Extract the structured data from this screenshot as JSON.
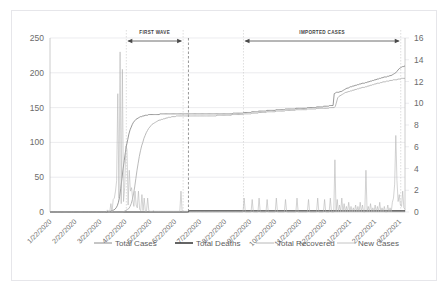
{
  "chart_data": {
    "type": "line",
    "title": "",
    "xlabel": "",
    "ylabel": "",
    "grid": true,
    "legend_position": "bottom",
    "y_left": {
      "label": "",
      "ticks": [
        0,
        50,
        100,
        150,
        200,
        250
      ],
      "ylim": [
        0,
        250
      ]
    },
    "y_right": {
      "label": "",
      "ticks": [
        0,
        2,
        4,
        6,
        8,
        10,
        12,
        14,
        16
      ],
      "ylim": [
        0,
        16
      ]
    },
    "x_tick_labels": [
      "1/22/2020",
      "2/22/2020",
      "3/22/2020",
      "4/22/2020",
      "5/22/2020",
      "6/22/2020",
      "7/22/2020",
      "8/22/2020",
      "9/22/2020",
      "10/22/2020",
      "11/22/2020",
      "12/22/2020",
      "1/22/2021",
      "2/22/2021",
      "3/22/2021"
    ],
    "annotations": [
      {
        "name": "first-wave",
        "label": "FIRST WAVE",
        "x_start": 0.215,
        "x_end": 0.375
      },
      {
        "name": "imported-cases",
        "label": "IMPORTED CASES",
        "x_start": 0.545,
        "x_end": 0.988
      }
    ],
    "vertical_markers": [
      {
        "name": "phase-divider",
        "x": 0.39
      }
    ],
    "series": [
      {
        "name": "Total Cases",
        "axis": "left",
        "color": "#7f7f7f",
        "width": 0.8,
        "values": [
          0,
          0,
          0,
          0,
          0,
          0,
          0,
          0,
          0,
          0,
          0,
          0,
          0,
          0,
          0,
          0,
          0,
          0,
          0,
          0,
          0,
          0,
          0,
          0,
          0,
          0,
          0,
          0,
          0,
          0,
          0,
          0,
          0,
          0,
          0,
          0,
          0,
          0,
          0,
          0,
          0,
          0,
          0,
          0,
          0,
          0,
          0,
          0,
          0,
          0,
          1,
          1,
          1,
          2,
          2,
          3,
          4,
          6,
          9,
          14,
          22,
          34,
          48,
          62,
          74,
          86,
          96,
          104,
          112,
          118,
          122,
          126,
          129,
          131,
          133,
          134,
          135,
          136,
          137,
          137,
          138,
          138,
          139,
          139,
          139,
          140,
          140,
          140,
          140,
          140,
          140,
          140,
          140,
          140,
          140,
          141,
          141,
          141,
          141,
          141,
          141,
          141,
          141,
          141,
          141,
          141,
          141,
          141,
          141,
          141,
          141,
          141,
          141,
          141,
          141,
          141,
          141,
          141,
          141,
          141,
          141,
          141,
          141,
          141,
          141,
          141,
          141,
          141,
          141,
          141,
          141,
          141,
          141,
          141,
          141,
          141,
          141,
          141,
          141,
          141,
          141,
          141,
          141,
          141,
          141,
          141,
          141,
          141,
          141,
          141,
          141,
          141,
          141,
          141,
          141,
          141,
          141,
          141,
          142,
          142,
          142,
          142,
          142,
          142,
          142,
          142,
          142,
          143,
          143,
          143,
          143,
          143,
          143,
          143,
          144,
          144,
          144,
          144,
          144,
          144,
          145,
          145,
          145,
          145,
          145,
          145,
          145,
          146,
          146,
          146,
          146,
          146,
          146,
          146,
          146,
          147,
          147,
          147,
          147,
          147,
          147,
          147,
          147,
          148,
          148,
          148,
          148,
          148,
          148,
          148,
          148,
          148,
          149,
          149,
          149,
          149,
          149,
          149,
          149,
          149,
          149,
          149,
          150,
          150,
          150,
          150,
          150,
          150,
          150,
          150,
          151,
          151,
          151,
          151,
          151,
          151,
          152,
          152,
          152,
          152,
          152,
          153,
          153,
          153,
          153,
          170,
          171,
          172,
          172,
          172,
          173,
          173,
          174,
          175,
          176,
          177,
          178,
          178,
          179,
          180,
          180,
          181,
          181,
          182,
          182,
          183,
          183,
          184,
          184,
          185,
          185,
          185,
          186,
          186,
          187,
          187,
          188,
          188,
          189,
          189,
          190,
          190,
          191,
          191,
          192,
          192,
          193,
          193,
          194,
          194,
          194,
          195,
          195,
          196,
          196,
          197,
          198,
          199,
          200,
          202,
          204,
          206,
          207,
          208,
          209,
          209,
          210
        ]
      },
      {
        "name": "Total Deaths",
        "axis": "right",
        "color": "#404040",
        "width": 1.1,
        "values": [
          0,
          0,
          0,
          0,
          0,
          0,
          0,
          0,
          0,
          0,
          0,
          0,
          0,
          0,
          0,
          0,
          0,
          0,
          0,
          0,
          0,
          0,
          0,
          0,
          0,
          0,
          0,
          0,
          0,
          0,
          0,
          0,
          0,
          0,
          0,
          0,
          0,
          0,
          0,
          0,
          0,
          0,
          0,
          0,
          0,
          0,
          0,
          0,
          0,
          0,
          0,
          0,
          0,
          0,
          0,
          0,
          0,
          0,
          0,
          0,
          0,
          0,
          0,
          0,
          0,
          0,
          0,
          0,
          0,
          0,
          0,
          0,
          0,
          0,
          0,
          0,
          0,
          0,
          0,
          0,
          0,
          0,
          0,
          0,
          0,
          0,
          0,
          0,
          0,
          0,
          0,
          0,
          0,
          0,
          0,
          0,
          0,
          0,
          0,
          0,
          0,
          0,
          0,
          0,
          0,
          0,
          0,
          0,
          0,
          0,
          0,
          0,
          0,
          0,
          0,
          0,
          0,
          0,
          0,
          0,
          0.1,
          0.1,
          0.1,
          0.1,
          0.1,
          0.1,
          0.1,
          0.1,
          0.1,
          0.1,
          0.1,
          0.1,
          0.1,
          0.1,
          0.1,
          0.1,
          0.1,
          0.1,
          0.1,
          0.1,
          0.1,
          0.1,
          0.1,
          0.1,
          0.1,
          0.1,
          0.1,
          0.1,
          0.1,
          0.1,
          0.1,
          0.1,
          0.1,
          0.1,
          0.1,
          0.1,
          0.1,
          0.1,
          0.1,
          0.1,
          0.1,
          0.1,
          0.1,
          0.1,
          0.1,
          0.1,
          0.1,
          0.1,
          0.1,
          0.1,
          0.1,
          0.1,
          0.1,
          0.1,
          0.1,
          0.1,
          0.1,
          0.1,
          0.1,
          0.1,
          0.1,
          0.1,
          0.1,
          0.1,
          0.1,
          0.1,
          0.1,
          0.1,
          0.1,
          0.1,
          0.1,
          0.1,
          0.1,
          0.1,
          0.1,
          0.1,
          0.1,
          0.1,
          0.1,
          0.1,
          0.1,
          0.1,
          0.1,
          0.1,
          0.1,
          0.1,
          0.1,
          0.1,
          0.1,
          0.1,
          0.1,
          0.1,
          0.1,
          0.1,
          0.1,
          0.1,
          0.1,
          0.1,
          0.1,
          0.1,
          0.1,
          0.1,
          0.1,
          0.1,
          0.1,
          0.1,
          0.1,
          0.1,
          0.1,
          0.1,
          0.1,
          0.1,
          0.1,
          0.1,
          0.1,
          0.1,
          0.1,
          0.1,
          0.1,
          0.1,
          0.1,
          0.1,
          0.1,
          0.1,
          0.1,
          0.1,
          0.1,
          0.1,
          0.1,
          0.1,
          0.1,
          0.1,
          0.1,
          0.1,
          0.1,
          0.1,
          0.1,
          0.1,
          0.1,
          0.1,
          0.1,
          0.1,
          0.1,
          0.1,
          0.1,
          0.1,
          0.1,
          0.1,
          0.1,
          0.1,
          0.1,
          0.1,
          0.1,
          0.1,
          0.1,
          0.1,
          0.1,
          0.1,
          0.1,
          0.1,
          0.1,
          0.1,
          0.1,
          0.1,
          0.1,
          0.1,
          0.1,
          0.1,
          0.1,
          0.1,
          0.1,
          0.1,
          0.1,
          0.1,
          0.1,
          0.1,
          0.1,
          0.1,
          0.1,
          0.1,
          0.1,
          0.1,
          0.1,
          0.1,
          0.1,
          0.1,
          0.1
        ]
      },
      {
        "name": "Total Recovered",
        "axis": "left",
        "color": "#a8a8a8",
        "width": 0.8,
        "values": [
          0,
          0,
          0,
          0,
          0,
          0,
          0,
          0,
          0,
          0,
          0,
          0,
          0,
          0,
          0,
          0,
          0,
          0,
          0,
          0,
          0,
          0,
          0,
          0,
          0,
          0,
          0,
          0,
          0,
          0,
          0,
          0,
          0,
          0,
          0,
          0,
          0,
          0,
          0,
          0,
          0,
          0,
          0,
          0,
          0,
          0,
          0,
          0,
          0,
          0,
          0,
          0,
          0,
          0,
          0,
          0,
          0,
          0,
          0,
          0,
          0,
          0,
          0,
          0,
          1,
          2,
          3,
          4,
          5,
          8,
          12,
          18,
          26,
          36,
          48,
          60,
          70,
          80,
          88,
          95,
          100,
          106,
          110,
          114,
          117,
          120,
          122,
          124,
          126,
          127,
          128,
          129,
          130,
          131,
          132,
          132,
          133,
          133,
          134,
          134,
          135,
          135,
          136,
          136,
          136,
          137,
          137,
          137,
          137,
          138,
          138,
          138,
          138,
          138,
          138,
          138,
          138,
          138,
          138,
          138,
          138,
          138,
          138,
          138,
          138,
          138,
          138,
          138,
          138,
          138,
          138,
          138,
          138,
          138,
          138,
          138,
          138,
          138,
          138,
          138,
          138,
          138,
          138,
          138,
          139,
          139,
          139,
          139,
          139,
          139,
          139,
          139,
          139,
          139,
          139,
          139,
          139,
          140,
          140,
          140,
          140,
          140,
          140,
          140,
          140,
          140,
          140,
          141,
          141,
          141,
          141,
          141,
          141,
          141,
          142,
          142,
          142,
          142,
          142,
          142,
          143,
          143,
          143,
          143,
          143,
          143,
          143,
          144,
          144,
          144,
          144,
          144,
          144,
          144,
          144,
          145,
          145,
          145,
          145,
          145,
          145,
          145,
          145,
          146,
          146,
          146,
          146,
          146,
          146,
          146,
          146,
          146,
          147,
          147,
          147,
          147,
          147,
          147,
          147,
          147,
          147,
          147,
          148,
          148,
          148,
          148,
          148,
          148,
          148,
          148,
          149,
          149,
          149,
          149,
          149,
          149,
          149,
          149,
          149,
          149,
          149,
          150,
          150,
          150,
          150,
          150,
          152,
          158,
          164,
          166,
          167,
          168,
          169,
          170,
          171,
          172,
          172,
          173,
          173,
          174,
          174,
          175,
          175,
          176,
          176,
          177,
          177,
          178,
          178,
          179,
          179,
          179,
          180,
          180,
          181,
          181,
          182,
          182,
          183,
          183,
          184,
          184,
          185,
          185,
          185,
          186,
          186,
          187,
          187,
          187,
          188,
          188,
          188,
          189,
          189,
          189,
          190,
          190,
          190,
          190,
          191,
          191,
          191,
          192,
          192,
          192,
          192
        ]
      },
      {
        "name": "New Cases",
        "axis": "left",
        "color": "#b5b5b5",
        "width": 0.6,
        "values": [
          0,
          0,
          0,
          0,
          0,
          0,
          0,
          0,
          0,
          0,
          0,
          0,
          0,
          0,
          0,
          0,
          0,
          0,
          0,
          0,
          0,
          0,
          0,
          0,
          0,
          0,
          0,
          0,
          0,
          0,
          0,
          0,
          0,
          0,
          0,
          0,
          0,
          0,
          0,
          0,
          0,
          0,
          0,
          0,
          0,
          0,
          0,
          0,
          0,
          0,
          3,
          0,
          0,
          12,
          0,
          18,
          20,
          30,
          45,
          170,
          20,
          230,
          12,
          205,
          15,
          35,
          95,
          90,
          10,
          60,
          30,
          35,
          18,
          8,
          30,
          10,
          6,
          30,
          4,
          2,
          25,
          2,
          20,
          1,
          1,
          20,
          2,
          1,
          1,
          1,
          2,
          1,
          1,
          1,
          1,
          1,
          1,
          1,
          1,
          1,
          1,
          1,
          1,
          1,
          1,
          1,
          1,
          1,
          1,
          1,
          1,
          1,
          1,
          1,
          30,
          1,
          1,
          1,
          1,
          1,
          0,
          0,
          0,
          0,
          0,
          0,
          0,
          0,
          0,
          0,
          0,
          0,
          0,
          0,
          0,
          0,
          0,
          0,
          0,
          0,
          0,
          0,
          0,
          0,
          0,
          0,
          0,
          0,
          0,
          0,
          0,
          0,
          0,
          0,
          0,
          0,
          0,
          0,
          0,
          0,
          0,
          0,
          0,
          0,
          0,
          0,
          0,
          0,
          0,
          20,
          0,
          0,
          0,
          0,
          0,
          0,
          18,
          0,
          0,
          0,
          0,
          0,
          20,
          0,
          0,
          0,
          0,
          0,
          0,
          18,
          0,
          0,
          0,
          0,
          0,
          0,
          0,
          20,
          0,
          0,
          0,
          0,
          0,
          0,
          0,
          18,
          0,
          0,
          0,
          0,
          0,
          0,
          0,
          0,
          0,
          20,
          0,
          0,
          0,
          0,
          0,
          0,
          0,
          0,
          0,
          18,
          0,
          0,
          0,
          0,
          0,
          0,
          0,
          20,
          0,
          0,
          0,
          0,
          0,
          18,
          0,
          0,
          0,
          0,
          20,
          0,
          0,
          0,
          75,
          0,
          18,
          0,
          10,
          0,
          20,
          0,
          12,
          0,
          8,
          0,
          14,
          0,
          8,
          0,
          6,
          0,
          10,
          0,
          8,
          0,
          14,
          0,
          10,
          0,
          0,
          60,
          0,
          8,
          0,
          12,
          0,
          6,
          0,
          10,
          0,
          8,
          0,
          14,
          0,
          6,
          0,
          8,
          0,
          0,
          10,
          0,
          6,
          0,
          14,
          20,
          40,
          110,
          45,
          15,
          25,
          10,
          8,
          30,
          6,
          4
        ]
      }
    ]
  },
  "legend": {
    "items": [
      {
        "label": "Total Cases",
        "color": "#7f7f7f",
        "width": 0.9
      },
      {
        "label": "Total Deaths",
        "color": "#3f3f3f",
        "width": 1.6
      },
      {
        "label": "Total Recovered",
        "color": "#b0b0b0",
        "width": 0.9
      },
      {
        "label": "New Cases",
        "color": "#bdbdbd",
        "width": 0.9
      }
    ]
  }
}
